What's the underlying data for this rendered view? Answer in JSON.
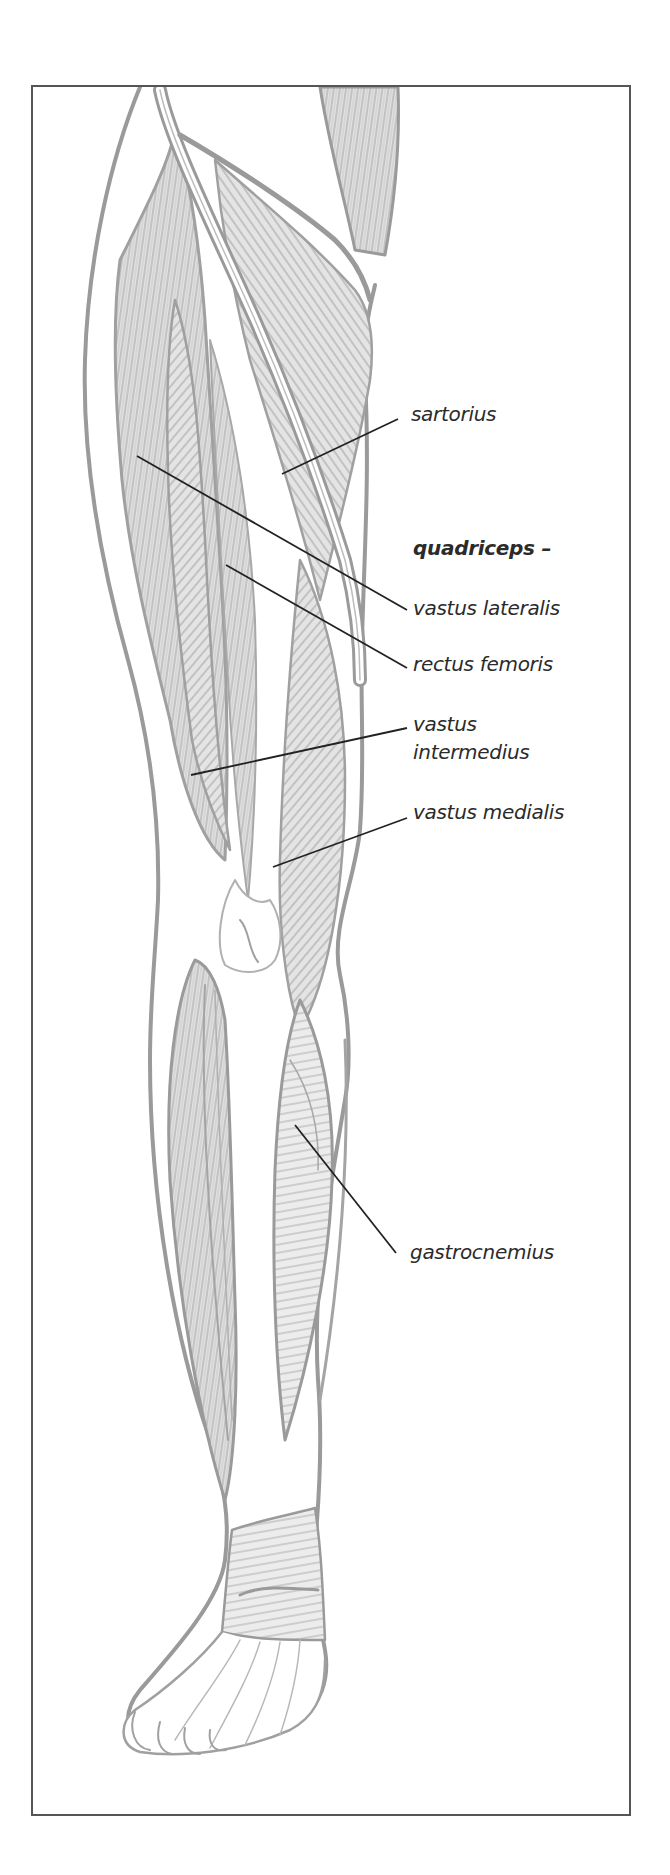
{
  "diagram": {
    "colors": {
      "frame": "#555555",
      "outline": "#9a9a9a",
      "muscle_fill": "#d8d8d8",
      "leader_line": "#222222",
      "label_text": "#2b2b2b"
    },
    "group_heading": "quadriceps –",
    "labels": [
      {
        "id": "sartorius",
        "text": "sartorius",
        "x": 411,
        "y": 402,
        "pointer": [
          282,
          474
        ]
      },
      {
        "id": "vastus-lateralis",
        "text": "vastus lateralis",
        "x": 413,
        "y": 596,
        "pointer": [
          137,
          456
        ]
      },
      {
        "id": "rectus-femoris",
        "text": "rectus femoris",
        "x": 413,
        "y": 652,
        "pointer": [
          226,
          565
        ]
      },
      {
        "id": "vastus-intermedius",
        "text": "vastus\nintermedius",
        "line1": "vastus",
        "line2": "intermedius",
        "x": 413,
        "y": 712,
        "pointer": [
          191,
          775
        ]
      },
      {
        "id": "vastus-medialis",
        "text": "vastus medialis",
        "x": 413,
        "y": 800,
        "pointer": [
          273,
          867
        ]
      },
      {
        "id": "gastrocnemius",
        "text": "gastrocnemius",
        "x": 410,
        "y": 1240,
        "pointer": [
          295,
          1125
        ]
      }
    ]
  }
}
